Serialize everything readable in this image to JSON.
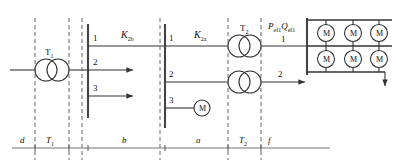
{
  "diagram": {
    "stroke_color": "#333333",
    "dash_color": "#666666",
    "source": {
      "name": "incoming-supply-line"
    },
    "transformers": [
      {
        "id": "T1",
        "label": "T",
        "sub": "1"
      },
      {
        "id": "T2a",
        "label": "T",
        "sub": "2"
      },
      {
        "id": "T2b",
        "label": "T",
        "sub": "2"
      }
    ],
    "fault_labels": [
      {
        "id": "K2b",
        "label": "K",
        "sub": "2b"
      },
      {
        "id": "K2a",
        "label": "K",
        "sub": "2a"
      }
    ],
    "power_label": {
      "p": "P",
      "p_sub": "ef1",
      "q": "Q",
      "q_sub": "ef1"
    },
    "bus_b_branches": [
      "1",
      "2",
      "3"
    ],
    "bus_a_branches": [
      "1",
      "2",
      "3"
    ],
    "bus_f_branch": "1",
    "t2b_out_branch": "2",
    "motor_symbol": "M",
    "motors_grid": [
      [
        "M",
        "M",
        "M"
      ],
      [
        "M",
        "M",
        "M"
      ]
    ],
    "branch_motor": "M",
    "axis_labels": [
      {
        "id": "d",
        "text": "d"
      },
      {
        "id": "T1",
        "text": "T",
        "sub": "1"
      },
      {
        "id": "b",
        "text": "b"
      },
      {
        "id": "a",
        "text": "a"
      },
      {
        "id": "T2",
        "text": "T",
        "sub": "2"
      },
      {
        "id": "f",
        "text": "f"
      }
    ]
  }
}
